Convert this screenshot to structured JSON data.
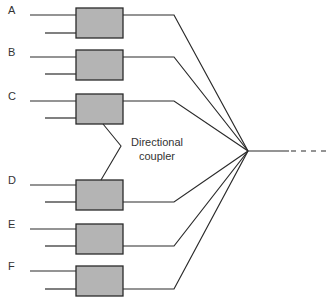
{
  "diagram": {
    "title": "",
    "channels": [
      {
        "label": "A",
        "box_y": 8,
        "in_top": 15,
        "in_bottom": 33,
        "out_from": "top"
      },
      {
        "label": "B",
        "box_y": 50,
        "in_top": 57,
        "in_bottom": 74,
        "out_from": "top"
      },
      {
        "label": "C",
        "box_y": 94,
        "in_top": 101,
        "in_bottom": 118,
        "out_from": "top"
      },
      {
        "label": "D",
        "box_y": 180,
        "in_top": 185,
        "in_bottom": 202,
        "out_from": "bottom"
      },
      {
        "label": "E",
        "box_y": 224,
        "in_top": 229,
        "in_bottom": 246,
        "out_from": "bottom"
      },
      {
        "label": "F",
        "box_y": 266,
        "in_top": 271,
        "in_bottom": 289,
        "out_from": "bottom"
      }
    ],
    "coupler_label_line1": "Directional",
    "coupler_label_line2": "coupler",
    "colors": {
      "box_fill": "#b4b4b4",
      "stroke": "#2a2a2a"
    }
  }
}
